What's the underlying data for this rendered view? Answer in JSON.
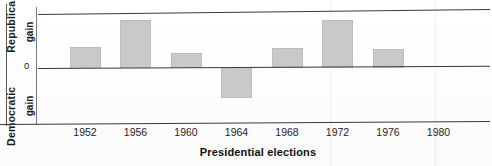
{
  "chart_data": {
    "type": "bar",
    "title": "",
    "xlabel": "Presidential elections",
    "ylabel": "Democratic gain / Republican gain",
    "categories": [
      "1952",
      "1956",
      "1960",
      "1964",
      "1968",
      "1972",
      "1976",
      "1980"
    ],
    "values": [
      21,
      48,
      15,
      -30,
      20,
      48,
      19,
      0
    ],
    "ylim": [
      -54,
      54
    ],
    "grid": false,
    "legend": null,
    "zero_tick_label": "0",
    "axis_top_label": "Republican",
    "axis_top_sub": "gain",
    "axis_bottom_label": "Democratic",
    "axis_bottom_sub": "gain",
    "bar_color": "#c9c9c9",
    "axis_color": "#3a3a3a"
  },
  "yaxis": {
    "outer_bottom": "Democratic",
    "outer_top": "Republican",
    "gain_top": "gain",
    "gain_bottom": "gain",
    "zero": "0"
  },
  "xaxis": {
    "title": "Presidential elections",
    "ticks": [
      "1952",
      "1956",
      "1960",
      "1964",
      "1968",
      "1972",
      "1976",
      "1980"
    ]
  }
}
